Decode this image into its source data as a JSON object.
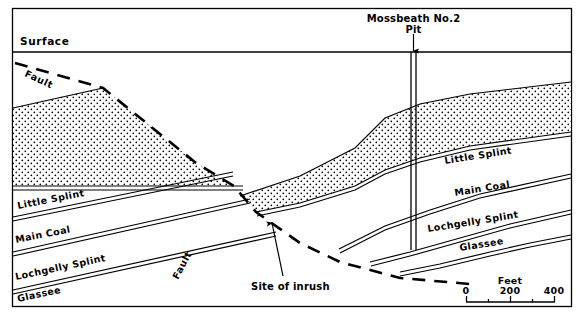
{
  "figure": {
    "type": "geological-cross-section",
    "background_color": "#ffffff",
    "line_color": "#000000",
    "frame": {
      "x": 12,
      "y": 8,
      "width": 560,
      "height": 299
    }
  },
  "labels": {
    "surface": "Surface",
    "fault_upper": "Fault",
    "fault_lower": "Fault",
    "pit_name": "Mossbeath No.2",
    "pit_word": "Pit",
    "site_of_inrush": "Site of inrush"
  },
  "seams_left": [
    {
      "name": "little-splint",
      "label": "Little Splint"
    },
    {
      "name": "main-coal",
      "label": "Main Coal"
    },
    {
      "name": "lochgelly-splint",
      "label": "Lochgelly Splint"
    },
    {
      "name": "glassee",
      "label": "Glassee"
    }
  ],
  "seams_right": [
    {
      "name": "little-splint",
      "label": "Little Splint"
    },
    {
      "name": "main-coal",
      "label": "Main Coal"
    },
    {
      "name": "lochgelly-splint",
      "label": "Lochgelly Splint"
    },
    {
      "name": "glassee",
      "label": "Glassee"
    }
  ],
  "scale_bar": {
    "unit_label": "Feet",
    "ticks": [
      "0",
      "200",
      "400"
    ],
    "minor_ticks": 2,
    "range_min": 0,
    "range_max": 400
  }
}
